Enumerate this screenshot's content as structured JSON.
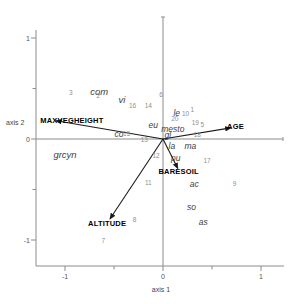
{
  "chart_data": {
    "type": "scatter",
    "subtype": "ordination_biplot",
    "title": "",
    "xlabel": "axis 1",
    "ylabel": "axis 2",
    "xlim": [
      -1.3,
      1.25
    ],
    "ylim": [
      -1.3,
      1.2
    ],
    "x_ticks": [
      -1,
      -0.5,
      0,
      0.5,
      1
    ],
    "y_ticks": [
      -1,
      -0.5,
      0,
      0.5,
      1
    ],
    "labeled_ticks": [
      -1,
      0,
      1
    ],
    "grid": false,
    "legend": "none",
    "env_vectors": [
      {
        "name": "MAXVEGHEIGHT",
        "x": -1.09,
        "y": 0.18,
        "label_x": -0.93,
        "label_y": 0.18
      },
      {
        "name": "AGE",
        "x": 0.69,
        "y": 0.11,
        "label_x": 0.74,
        "label_y": 0.12
      },
      {
        "name": "ALTITUDE",
        "x": -0.54,
        "y": -0.79,
        "label_x": -0.57,
        "label_y": -0.84
      },
      {
        "name": "BARESOIL",
        "x": 0.15,
        "y": -0.29,
        "label_x": 0.16,
        "label_y": -0.33
      }
    ],
    "species_scores": [
      {
        "label": "com",
        "x": -0.65,
        "y": 0.47,
        "size": "lg"
      },
      {
        "label": "vi",
        "x": -0.42,
        "y": 0.39,
        "size": "lg"
      },
      {
        "label": "le",
        "x": 0.14,
        "y": 0.26,
        "size": "md"
      },
      {
        "label": "eu",
        "x": -0.1,
        "y": 0.14,
        "size": "md"
      },
      {
        "label": "mesto",
        "x": 0.1,
        "y": 0.1,
        "size": "md"
      },
      {
        "label": "gl",
        "x": 0.05,
        "y": 0.04,
        "size": "md"
      },
      {
        "label": "la",
        "x": 0.09,
        "y": -0.07,
        "size": "md"
      },
      {
        "label": "ma",
        "x": 0.28,
        "y": -0.07,
        "size": "md"
      },
      {
        "label": "co",
        "x": -0.45,
        "y": 0.05,
        "size": "md"
      },
      {
        "label": "grcyn",
        "x": -1.0,
        "y": -0.16,
        "size": "lg"
      },
      {
        "label": "pu",
        "x": 0.13,
        "y": -0.19,
        "size": "md"
      },
      {
        "label": "ac",
        "x": 0.32,
        "y": -0.45,
        "size": "md"
      },
      {
        "label": "so",
        "x": 0.29,
        "y": -0.67,
        "size": "md"
      },
      {
        "label": "as",
        "x": 0.41,
        "y": -0.82,
        "size": "md"
      }
    ],
    "site_scores": [
      {
        "label": "1",
        "x": 0.3,
        "y": 0.29
      },
      {
        "label": "2",
        "x": -0.66,
        "y": 0.43
      },
      {
        "label": "3",
        "x": -0.94,
        "y": 0.46
      },
      {
        "label": "5",
        "x": 0.4,
        "y": 0.14
      },
      {
        "label": "6",
        "x": -0.02,
        "y": 0.44
      },
      {
        "label": "7",
        "x": -0.61,
        "y": -1.01
      },
      {
        "label": "8",
        "x": -0.29,
        "y": -0.8
      },
      {
        "label": "9",
        "x": 0.73,
        "y": -0.45
      },
      {
        "label": "10",
        "x": 0.23,
        "y": 0.25
      },
      {
        "label": "11",
        "x": -0.15,
        "y": -0.44
      },
      {
        "label": "12",
        "x": -0.07,
        "y": -0.17
      },
      {
        "label": "13",
        "x": -0.19,
        "y": -0.01
      },
      {
        "label": "14",
        "x": -0.15,
        "y": 0.33
      },
      {
        "label": "15",
        "x": -0.37,
        "y": 0.05
      },
      {
        "label": "16",
        "x": -0.31,
        "y": 0.33
      },
      {
        "label": "17",
        "x": 0.45,
        "y": -0.22
      },
      {
        "label": "18",
        "x": 0.35,
        "y": 0.04
      },
      {
        "label": "19",
        "x": 0.33,
        "y": 0.16
      },
      {
        "label": "20",
        "x": 0.12,
        "y": 0.2
      }
    ]
  },
  "colors": {
    "background": "#ffffff",
    "axis_line": "#8c8c8c",
    "vector_line": "#1a1a1a",
    "env_label": "#000000",
    "species_label": "#3f3f3f",
    "site_number": "#8f8f8f",
    "tick_label": "#555555"
  }
}
